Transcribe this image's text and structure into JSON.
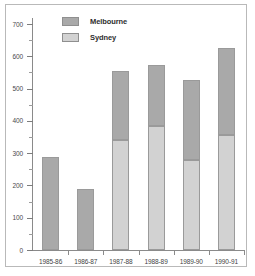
{
  "chart_data": {
    "type": "bar",
    "subtype": "stacked-bar",
    "title": "",
    "xlabel": "",
    "ylabel": "",
    "categories": [
      "1985-86",
      "1986-87",
      "1987-88",
      "1988-89",
      "1989-90",
      "1990-91"
    ],
    "series": [
      {
        "name": "Sydney",
        "color": "#d2d2d2",
        "values": [
          0,
          0,
          340,
          385,
          280,
          355
        ]
      },
      {
        "name": "Melbourne",
        "color": "#a9a9a9",
        "values": [
          288,
          188,
          215,
          188,
          248,
          272
        ]
      }
    ],
    "totals": [
      288,
      188,
      555,
      573,
      528,
      627
    ],
    "ylim": [
      0,
      700
    ],
    "yticks": [
      0,
      100,
      200,
      300,
      400,
      500,
      600,
      700
    ],
    "ytick_labels": [
      "0",
      "100",
      "200",
      "300",
      "400",
      "500",
      "600",
      "700"
    ],
    "yticks_minor": [
      50,
      150,
      250,
      350,
      450,
      550,
      650
    ],
    "grid": false,
    "legend_position": "top-left",
    "legend": [
      {
        "label": "Melbourne",
        "color": "#a9a9a9"
      },
      {
        "label": "Sydney",
        "color": "#d2d2d2"
      }
    ]
  }
}
